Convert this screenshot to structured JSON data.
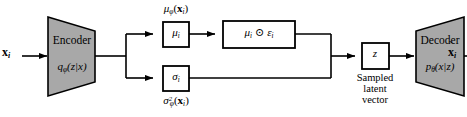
{
  "diagram": {
    "type": "flow-diagram",
    "background_color": "#ffffff",
    "shape_fill_color": "#a8a8a8",
    "box_fill_color": "#ffffff",
    "stroke_color": "#000000"
  },
  "input": {
    "label_x": "x",
    "label_sub": "i"
  },
  "encoder": {
    "name": "Encoder",
    "distribution_fn": "q",
    "distribution_sub": "φ",
    "distribution_args": "(z|x)"
  },
  "mu_branch": {
    "top_label_fn": "μ",
    "top_label_sub": "φ",
    "top_label_args_x": "x",
    "top_label_args_sub": "i",
    "box_symbol": "μ",
    "box_sub": "i"
  },
  "sigma_branch": {
    "box_symbol": "σ",
    "box_sub": "i",
    "bottom_label_fn": "σ",
    "bottom_label_sup": "2",
    "bottom_label_sub": "φ",
    "bottom_label_args_x": "x",
    "bottom_label_args_sub": "i"
  },
  "reparam": {
    "mu_symbol": "μ",
    "mu_sub": "i",
    "operator": "⊙",
    "eps_symbol": "ε",
    "eps_sub": "i"
  },
  "latent": {
    "box_symbol": "z",
    "caption_line1": "Sampled",
    "caption_line2": "latent",
    "caption_line3": "vector"
  },
  "decoder": {
    "name": "Decoder",
    "distribution_fn": "p",
    "distribution_sub": "θ",
    "distribution_args": "(x|z)"
  },
  "output": {
    "label_x": "x",
    "label_sub": "i",
    "tilde": "˜"
  }
}
